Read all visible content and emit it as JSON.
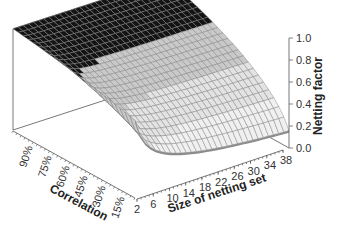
{
  "chart_data": {
    "type": "surface3d",
    "title": "",
    "xlabel": "Size of netting set",
    "ylabel": "Correlation",
    "zlabel": "Netting factor",
    "x_ticks": [
      "2",
      "6",
      "10",
      "14",
      "18",
      "22",
      "26",
      "30",
      "34",
      "38"
    ],
    "y_ticks": [
      "90%",
      "75%",
      "60%",
      "45%",
      "30%",
      "15%"
    ],
    "z_ticks": [
      "0.0",
      "0.2",
      "0.4",
      "0.6",
      "0.8",
      "1.0"
    ],
    "zlim": [
      0,
      1
    ],
    "x_range": [
      2,
      40
    ],
    "y_range": [
      0.0,
      1.0
    ],
    "formula_hint": "netting factor = sqrt(rho + (1 - rho) / n)",
    "legend": "none (shaded bands per 0.2 interval)",
    "bands": [
      {
        "range": [
          0.0,
          0.2
        ],
        "color": "#3a3a3a"
      },
      {
        "range": [
          0.2,
          0.4
        ],
        "color": "#f0f0f0"
      },
      {
        "range": [
          0.4,
          0.6
        ],
        "color": "#e3e3e3"
      },
      {
        "range": [
          0.6,
          0.8
        ],
        "color": "#c9c9c9"
      },
      {
        "range": [
          0.8,
          1.0
        ],
        "color": "#141414"
      }
    ],
    "sample_values": {
      "n": [
        2,
        6,
        10,
        14,
        18,
        22,
        26,
        30,
        34,
        38
      ],
      "series": [
        {
          "name": "rho=90%",
          "values": [
            0.97,
            0.96,
            0.95,
            0.95,
            0.95,
            0.95,
            0.95,
            0.95,
            0.95,
            0.95
          ]
        },
        {
          "name": "rho=60%",
          "values": [
            0.89,
            0.82,
            0.8,
            0.79,
            0.79,
            0.78,
            0.78,
            0.78,
            0.78,
            0.78
          ]
        },
        {
          "name": "rho=30%",
          "values": [
            0.81,
            0.66,
            0.61,
            0.59,
            0.58,
            0.57,
            0.57,
            0.56,
            0.56,
            0.56
          ]
        },
        {
          "name": "rho=15%",
          "values": [
            0.76,
            0.57,
            0.5,
            0.47,
            0.45,
            0.44,
            0.43,
            0.42,
            0.42,
            0.41
          ]
        },
        {
          "name": "rho=0%",
          "values": [
            0.71,
            0.41,
            0.32,
            0.27,
            0.24,
            0.21,
            0.2,
            0.18,
            0.17,
            0.16
          ]
        }
      ]
    }
  }
}
